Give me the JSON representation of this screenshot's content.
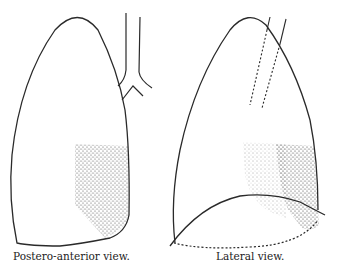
{
  "figure": {
    "panels": [
      {
        "caption": "Postero-anterior view."
      },
      {
        "caption": "Lateral view."
      }
    ],
    "colors": {
      "ink": "#2a2a2a",
      "paper": "#ffffff"
    }
  }
}
